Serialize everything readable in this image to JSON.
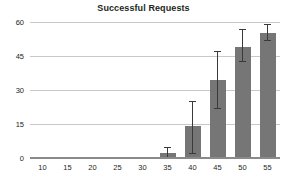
{
  "chart_data": {
    "type": "bar",
    "title": "Successful Requests",
    "xlabel": "",
    "ylabel": "",
    "categories": [
      "10",
      "15",
      "20",
      "25",
      "30",
      "35",
      "40",
      "45",
      "50",
      "55"
    ],
    "values": [
      0,
      0,
      0,
      0.3,
      0.6,
      2,
      14,
      34.5,
      49,
      55
    ],
    "error_low": [
      0,
      0,
      0,
      0,
      0,
      0,
      2,
      22,
      43,
      52
    ],
    "error_high": [
      0,
      0,
      0,
      0,
      0,
      5,
      25,
      47,
      57,
      59
    ],
    "has_error_bars": [
      false,
      false,
      false,
      false,
      false,
      true,
      true,
      true,
      true,
      true
    ],
    "ylim": [
      0,
      60
    ],
    "yticks": [
      "0",
      "15",
      "30",
      "45",
      "60"
    ],
    "ytick_values": [
      0,
      15,
      30,
      45,
      60
    ],
    "grid": true,
    "legend": null,
    "bar_color": "#767676",
    "grid_color": "#c9c9c9",
    "axis_color": "#8a8a8a",
    "error_color": "#3a3a3a",
    "text_color": "#231f20"
  }
}
